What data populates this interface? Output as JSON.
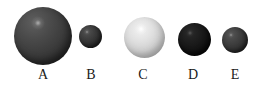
{
  "figure": {
    "background_color": "#ffffff",
    "width": 264,
    "height": 86
  },
  "spheres": [
    {
      "id": "A",
      "label": "A",
      "size_rank": "largest",
      "diameter_px": 58,
      "shade": "dark gray",
      "base_color": "#3a3a3a",
      "highlight_color": "#bebebe"
    },
    {
      "id": "B",
      "label": "B",
      "size_rank": "smallest",
      "diameter_px": 23,
      "shade": "dark gray",
      "base_color": "#2e2e2e",
      "highlight_color": "#aaaaaa"
    },
    {
      "id": "C",
      "label": "C",
      "size_rank": "medium",
      "diameter_px": 41,
      "shade": "light silver",
      "base_color": "#cfcfcf",
      "highlight_color": "#ffffff"
    },
    {
      "id": "D",
      "label": "D",
      "size_rank": "medium-small",
      "diameter_px": 33,
      "shade": "near black",
      "base_color": "#121212",
      "highlight_color": "#787878"
    },
    {
      "id": "E",
      "label": "E",
      "size_rank": "small",
      "diameter_px": 26,
      "shade": "dark gray",
      "base_color": "#323232",
      "highlight_color": "#afafaf"
    }
  ]
}
